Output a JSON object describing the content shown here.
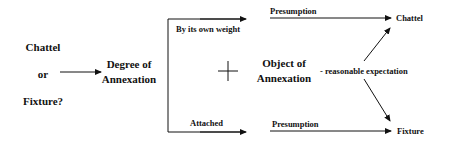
{
  "diagram": {
    "question": {
      "line1": "Chattel",
      "line2": "or",
      "line3": "Fixture?"
    },
    "degree_node": {
      "line1": "Degree of",
      "line2": "Annexation"
    },
    "branches": {
      "top_label": "By its own weight",
      "bottom_label": "Attached"
    },
    "operator": "+",
    "object_node": {
      "line1": "Object of",
      "line2": "Annexation"
    },
    "presumption_top": "Presumption",
    "presumption_bottom": "Presumption",
    "reasonable_expectation": "- reasonable expectation",
    "outcomes": {
      "top": "Chattel",
      "bottom": "Fixture"
    },
    "colors": {
      "line": "#111111",
      "text": "#111111",
      "background": "#ffffff"
    }
  }
}
